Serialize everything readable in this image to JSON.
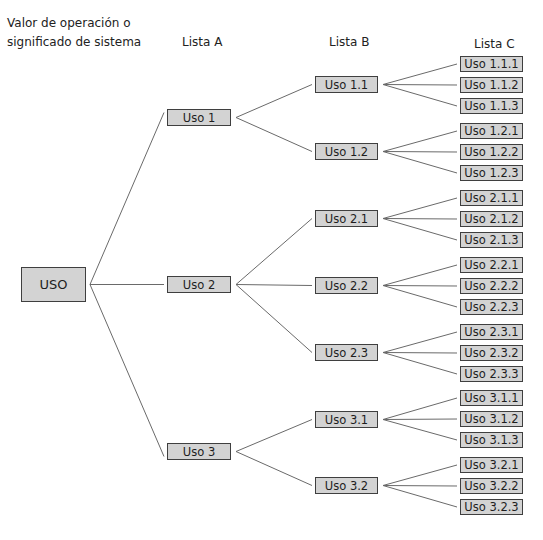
{
  "headers": {
    "col0_line1": "Valor de operación o",
    "col0_line2": "significado de sistema",
    "col1": "Lista A",
    "col2": "Lista B",
    "col3": "Lista C"
  },
  "root": {
    "label": "USO",
    "x": 21,
    "y": 267,
    "w": 65,
    "h": 35
  },
  "lista_a": [
    {
      "label": "Uso 1",
      "y": 109
    },
    {
      "label": "Uso 2",
      "y": 276
    },
    {
      "label": "Uso 3",
      "y": 443
    }
  ],
  "lista_b": [
    {
      "label": "Uso 1.1",
      "parent": 0,
      "y": 76
    },
    {
      "label": "Uso 1.2",
      "parent": 0,
      "y": 143
    },
    {
      "label": "Uso 2.1",
      "parent": 1,
      "y": 210
    },
    {
      "label": "Uso 2.2",
      "parent": 1,
      "y": 277
    },
    {
      "label": "Uso 2.3",
      "parent": 1,
      "y": 344
    },
    {
      "label": "Uso 3.1",
      "parent": 2,
      "y": 411
    },
    {
      "label": "Uso 3.2",
      "parent": 2,
      "y": 477
    }
  ],
  "lista_c": [
    {
      "label": "Uso 1.1.1",
      "parent": 0,
      "y": 56
    },
    {
      "label": "Uso 1.1.2",
      "parent": 0,
      "y": 77
    },
    {
      "label": "Uso 1.1.3",
      "parent": 0,
      "y": 98
    },
    {
      "label": "Uso 1.2.1",
      "parent": 1,
      "y": 123
    },
    {
      "label": "Uso 1.2.2",
      "parent": 1,
      "y": 144
    },
    {
      "label": "Uso 1.2.3",
      "parent": 1,
      "y": 165
    },
    {
      "label": "Uso 2.1.1",
      "parent": 2,
      "y": 190
    },
    {
      "label": "Uso 2.1.2",
      "parent": 2,
      "y": 211
    },
    {
      "label": "Uso 2.1.3",
      "parent": 2,
      "y": 232
    },
    {
      "label": "Uso 2.2.1",
      "parent": 3,
      "y": 257
    },
    {
      "label": "Uso 2.2.2",
      "parent": 3,
      "y": 278
    },
    {
      "label": "Uso 2.2.3",
      "parent": 3,
      "y": 299
    },
    {
      "label": "Uso 2.3.1",
      "parent": 4,
      "y": 324
    },
    {
      "label": "Uso 2.3.2",
      "parent": 4,
      "y": 345
    },
    {
      "label": "Uso 2.3.3",
      "parent": 4,
      "y": 366
    },
    {
      "label": "Uso 3.1.1",
      "parent": 5,
      "y": 390
    },
    {
      "label": "Uso 3.1.2",
      "parent": 5,
      "y": 411
    },
    {
      "label": "Uso 3.1.3",
      "parent": 5,
      "y": 432
    },
    {
      "label": "Uso 3.2.1",
      "parent": 6,
      "y": 457
    },
    {
      "label": "Uso 3.2.2",
      "parent": 6,
      "y": 478
    },
    {
      "label": "Uso 3.2.3",
      "parent": 6,
      "y": 499
    }
  ],
  "colors": {
    "box_fill": "#d3d3d3",
    "box_border": "#3f3f3f",
    "line": "#6a6a6a"
  }
}
